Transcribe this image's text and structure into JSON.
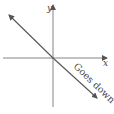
{
  "diagram": {
    "axes": {
      "x_label": "x",
      "y_label": "y"
    },
    "line": {
      "slope": "negative",
      "label": "Goes down"
    },
    "colors": {
      "axis": "#555555",
      "line": "#555555",
      "text": "#444444"
    }
  }
}
